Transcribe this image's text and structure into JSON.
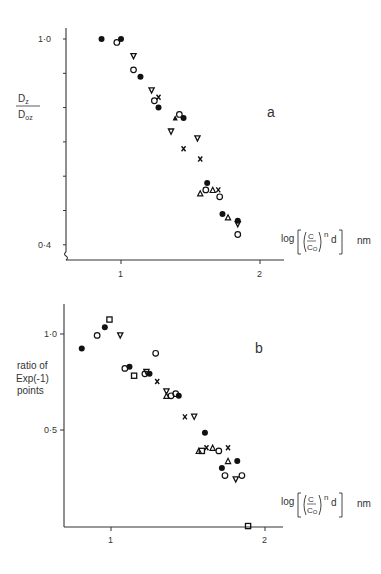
{
  "chart_data": [
    {
      "type": "scatter",
      "panel_label": "a",
      "ylabel_num": "D",
      "ylabel_num_sub": "z",
      "ylabel_den": "D",
      "ylabel_den_sub": "oz",
      "xlabel": "log[(C/Co)^n d]",
      "xlabel_unit": "nm",
      "xlim": [
        0.67,
        2.2
      ],
      "ylim": [
        0.35,
        1.05
      ],
      "yticks": [
        0.4,
        0.5,
        0.6,
        0.7,
        0.8,
        0.9,
        1.0
      ],
      "ytick_labels": {
        "0.4": "0·4",
        "1.0": "1·0"
      },
      "xticks": [
        1,
        2
      ],
      "xtick_labels": [
        "1",
        "2"
      ],
      "grid": false,
      "series": [
        {
          "marker": "filled-circle",
          "points": [
            [
              0.86,
              1.0
            ],
            [
              1.0,
              1.0
            ],
            [
              1.14,
              0.89
            ],
            [
              1.27,
              0.8
            ],
            [
              1.45,
              0.77
            ],
            [
              1.62,
              0.58
            ],
            [
              1.73,
              0.49
            ],
            [
              1.84,
              0.47
            ]
          ]
        },
        {
          "marker": "open-circle",
          "points": [
            [
              0.97,
              0.99
            ],
            [
              1.09,
              0.91
            ],
            [
              1.24,
              0.82
            ],
            [
              1.42,
              0.78
            ],
            [
              1.61,
              0.56
            ],
            [
              1.71,
              0.54
            ],
            [
              1.84,
              0.43
            ]
          ]
        },
        {
          "marker": "open-triangle-down",
          "points": [
            [
              1.09,
              0.95
            ],
            [
              1.22,
              0.85
            ],
            [
              1.36,
              0.73
            ],
            [
              1.55,
              0.71
            ],
            [
              1.84,
              0.46
            ]
          ]
        },
        {
          "marker": "filled-triangle-up",
          "points": [
            [
              1.39,
              0.77
            ]
          ]
        },
        {
          "marker": "open-triangle-up",
          "points": [
            [
              1.57,
              0.55
            ],
            [
              1.66,
              0.56
            ],
            [
              1.77,
              0.48
            ]
          ]
        },
        {
          "marker": "cross",
          "points": [
            [
              1.27,
              0.83
            ],
            [
              1.45,
              0.68
            ],
            [
              1.57,
              0.65
            ],
            [
              1.7,
              0.56
            ]
          ]
        }
      ]
    },
    {
      "type": "scatter",
      "panel_label": "b",
      "ylabel": "ratio of Exp(-1) points",
      "xlabel": "log[(C/Co)^n d]",
      "xlabel_unit": "nm",
      "xlim": [
        0.67,
        2.1
      ],
      "ylim": [
        0.25,
        1.2
      ],
      "yscale": "log",
      "yticks": [
        0.5,
        1.0
      ],
      "ytick_labels": {
        "0.5": "0·5",
        "1.0": "1·0"
      },
      "xticks": [
        1,
        2
      ],
      "xtick_labels": [
        "1",
        "2"
      ],
      "grid": false,
      "series": [
        {
          "marker": "filled-circle",
          "points": [
            [
              0.81,
              0.9
            ],
            [
              0.96,
              1.05
            ],
            [
              1.12,
              0.79
            ],
            [
              1.25,
              0.75
            ],
            [
              1.44,
              0.64
            ],
            [
              1.61,
              0.49
            ],
            [
              1.72,
              0.38
            ],
            [
              1.82,
              0.4
            ]
          ]
        },
        {
          "marker": "open-circle",
          "points": [
            [
              0.91,
              0.99
            ],
            [
              1.09,
              0.78
            ],
            [
              1.29,
              0.87
            ],
            [
              1.22,
              0.75
            ],
            [
              1.39,
              0.64
            ],
            [
              1.42,
              0.65
            ],
            [
              1.7,
              0.43
            ],
            [
              1.74,
              0.36
            ],
            [
              1.85,
              0.36
            ]
          ]
        },
        {
          "marker": "open-square",
          "points": [
            [
              0.99,
              1.11
            ],
            [
              1.15,
              0.74
            ],
            [
              1.59,
              0.43
            ],
            [
              1.89,
              0.25
            ]
          ]
        },
        {
          "marker": "open-triangle-down",
          "points": [
            [
              1.06,
              0.99
            ],
            [
              1.23,
              0.76
            ],
            [
              1.36,
              0.66
            ],
            [
              1.54,
              0.55
            ],
            [
              1.81,
              0.35
            ]
          ]
        },
        {
          "marker": "open-triangle-up",
          "points": [
            [
              1.36,
              0.64
            ],
            [
              1.57,
              0.43
            ],
            [
              1.66,
              0.44
            ],
            [
              1.76,
              0.4
            ]
          ]
        },
        {
          "marker": "cross",
          "points": [
            [
              1.3,
              0.71
            ],
            [
              1.48,
              0.55
            ],
            [
              1.62,
              0.44
            ],
            [
              1.76,
              0.44
            ]
          ]
        }
      ]
    }
  ]
}
